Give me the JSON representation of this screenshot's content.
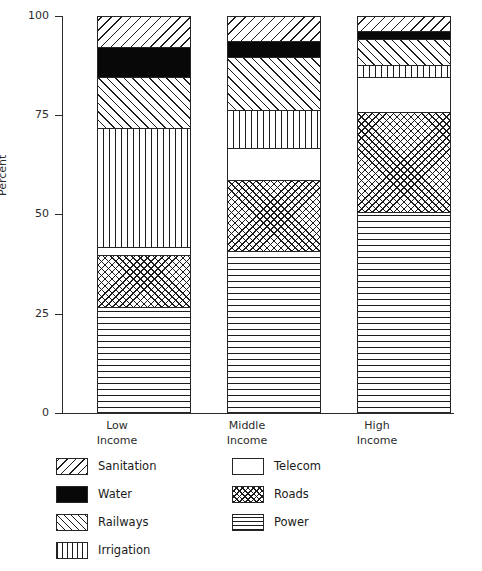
{
  "chart_data": {
    "type": "bar",
    "subtype": "stacked-bar-percent",
    "title": "",
    "subtitle": "",
    "xlabel": "",
    "ylabel": "Percent",
    "ylim": [
      0,
      100
    ],
    "yticks": [
      0,
      25,
      50,
      75,
      100
    ],
    "ytick_labels": [
      "0",
      "25",
      "50",
      "75",
      "100"
    ],
    "grid": false,
    "legend_position": "below-plot-two-columns",
    "categories": [
      "Low Income",
      "Middle Income",
      "High Income"
    ],
    "category_lines": [
      [
        "Low",
        "Income"
      ],
      [
        "Middle",
        "Income"
      ],
      [
        "High",
        "Income"
      ]
    ],
    "stack_order_bottom_to_top": [
      "Power",
      "Roads",
      "Telecom",
      "Irrigation",
      "Railways",
      "Water",
      "Sanitation"
    ],
    "series": [
      {
        "name": "Power",
        "pattern": "horizontal-lines",
        "values": [
          27,
          41,
          51
        ]
      },
      {
        "name": "Roads",
        "pattern": "crosshatch",
        "values": [
          13,
          18,
          25
        ]
      },
      {
        "name": "Telecom",
        "pattern": "solid-white",
        "values": [
          2,
          8,
          9
        ]
      },
      {
        "name": "Irrigation",
        "pattern": "vertical-lines",
        "values": [
          30,
          9.5,
          3
        ]
      },
      {
        "name": "Railways",
        "pattern": "diagonal-dense-up",
        "values": [
          13,
          13.5,
          6.5
        ]
      },
      {
        "name": "Water",
        "pattern": "solid-black",
        "values": [
          7.5,
          4,
          2
        ]
      },
      {
        "name": "Sanitation",
        "pattern": "diagonal-sparse-down",
        "values": [
          7.5,
          6,
          3.5
        ]
      }
    ],
    "cumulative_tops": {
      "Low Income": {
        "Power": 27,
        "Roads": 40,
        "Telecom": 42,
        "Irrigation": 72,
        "Railways": 85,
        "Water": 92.5,
        "Sanitation": 100
      },
      "Middle Income": {
        "Power": 41,
        "Roads": 59,
        "Telecom": 67,
        "Irrigation": 76.5,
        "Railways": 90,
        "Water": 94,
        "Sanitation": 100
      },
      "High Income": {
        "Power": 51,
        "Roads": 76,
        "Telecom": 85,
        "Irrigation": 88,
        "Railways": 94.5,
        "Water": 96.5,
        "Sanitation": 100
      }
    }
  },
  "legend": {
    "column_left": [
      {
        "label": "Sanitation",
        "pattern": "pat-sanitation"
      },
      {
        "label": "Water",
        "pattern": "pat-water"
      },
      {
        "label": "Railways",
        "pattern": "pat-railways"
      },
      {
        "label": "Irrigation",
        "pattern": "pat-irrigation"
      }
    ],
    "column_right": [
      {
        "label": "Telecom",
        "pattern": "pat-telecom"
      },
      {
        "label": "Roads",
        "pattern": "pat-roads"
      },
      {
        "label": "Power",
        "pattern": "pat-power"
      }
    ]
  },
  "axis": {
    "y_title": "Percent",
    "ticks": [
      "100",
      "75",
      "50",
      "25",
      "0"
    ]
  },
  "colors": {
    "ink": "#1c1c1c",
    "axis": "#2b2b2b",
    "paper": "#ffffff",
    "water_fill": "#080808"
  }
}
